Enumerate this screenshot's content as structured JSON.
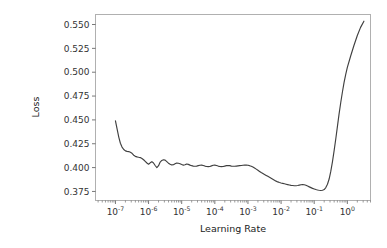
{
  "figure": {
    "background_color": "#ffffff",
    "line_color": "#404040",
    "spine_color": "#b0b0b0",
    "tick_color": "#555555",
    "text_color": "#333333"
  },
  "chart_data": {
    "type": "line",
    "title": "",
    "xlabel": "Learning Rate",
    "ylabel": "Loss",
    "xscale": "log",
    "yscale": "linear",
    "grid": false,
    "legend": null,
    "xlim": [
      2.5e-08,
      5.0
    ],
    "ylim": [
      0.3655,
      0.5605
    ],
    "xticks": [
      1e-07,
      1e-06,
      1e-05,
      0.0001,
      0.001,
      0.01,
      0.1,
      1
    ],
    "xtick_labels": [
      "10⁻⁷",
      "10⁻⁶",
      "10⁻⁵",
      "10⁻⁴",
      "10⁻³",
      "10⁻²",
      "10⁻¹",
      "10⁰"
    ],
    "xtick_mantissa": [
      "10",
      "10",
      "10",
      "10",
      "10",
      "10",
      "10",
      "10"
    ],
    "xtick_exponent": [
      "-7",
      "-6",
      "-5",
      "-4",
      "-3",
      "-2",
      "-1",
      "0"
    ],
    "yticks": [
      0.375,
      0.4,
      0.425,
      0.45,
      0.475,
      0.5,
      0.525,
      0.55
    ],
    "ytick_labels": [
      "0.375",
      "0.400",
      "0.425",
      "0.450",
      "0.475",
      "0.500",
      "0.525",
      "0.550"
    ],
    "series": [
      {
        "name": "loss",
        "color": "#404040",
        "x": [
          1e-07,
          1.12e-07,
          1.26e-07,
          1.41e-07,
          1.58e-07,
          1.78e-07,
          2e-07,
          2.24e-07,
          2.51e-07,
          2.82e-07,
          3.16e-07,
          3.55e-07,
          3.98e-07,
          4.47e-07,
          5.01e-07,
          5.62e-07,
          6.31e-07,
          7.08e-07,
          7.94e-07,
          8.91e-07,
          1e-06,
          1.12e-06,
          1.26e-06,
          1.41e-06,
          1.58e-06,
          1.78e-06,
          2e-06,
          2.24e-06,
          2.51e-06,
          2.82e-06,
          3.16e-06,
          3.55e-06,
          3.98e-06,
          4.47e-06,
          5.01e-06,
          5.62e-06,
          6.31e-06,
          7.08e-06,
          7.94e-06,
          8.91e-06,
          1e-05,
          1.12e-05,
          1.26e-05,
          1.41e-05,
          1.58e-05,
          1.78e-05,
          2e-05,
          2.24e-05,
          2.51e-05,
          2.82e-05,
          3.16e-05,
          3.55e-05,
          3.98e-05,
          4.47e-05,
          5.01e-05,
          5.62e-05,
          6.31e-05,
          7.08e-05,
          7.94e-05,
          8.91e-05,
          0.0001,
          0.000112,
          0.000126,
          0.000141,
          0.000158,
          0.000178,
          0.0002,
          0.000224,
          0.000251,
          0.000282,
          0.000316,
          0.000355,
          0.000398,
          0.000447,
          0.000501,
          0.000562,
          0.000631,
          0.000708,
          0.000794,
          0.000891,
          0.001,
          0.00112,
          0.00126,
          0.00141,
          0.00158,
          0.00178,
          0.002,
          0.00224,
          0.00251,
          0.00282,
          0.00316,
          0.00355,
          0.00398,
          0.00447,
          0.00501,
          0.00562,
          0.00631,
          0.00708,
          0.00794,
          0.00891,
          0.01,
          0.0112,
          0.0126,
          0.0141,
          0.0158,
          0.0178,
          0.02,
          0.0224,
          0.0251,
          0.0282,
          0.0316,
          0.0355,
          0.0398,
          0.0447,
          0.0501,
          0.0562,
          0.0631,
          0.0708,
          0.0794,
          0.0891,
          0.1,
          0.112,
          0.126,
          0.141,
          0.158,
          0.178,
          0.2,
          0.224,
          0.251,
          0.282,
          0.316,
          0.355,
          0.398,
          0.447,
          0.501,
          0.562,
          0.631,
          0.708,
          0.794,
          0.891,
          1.0,
          1.26,
          1.58,
          2.0,
          2.51,
          3.16
        ],
        "y": [
          0.449,
          0.4405,
          0.432,
          0.4255,
          0.4215,
          0.419,
          0.4175,
          0.417,
          0.4168,
          0.416,
          0.415,
          0.413,
          0.4118,
          0.4112,
          0.4108,
          0.4105,
          0.4095,
          0.4082,
          0.4065,
          0.4048,
          0.4035,
          0.405,
          0.4062,
          0.4048,
          0.4022,
          0.4,
          0.402,
          0.4058,
          0.4075,
          0.4082,
          0.4078,
          0.4062,
          0.4046,
          0.4035,
          0.4028,
          0.403,
          0.404,
          0.4048,
          0.4046,
          0.404,
          0.4032,
          0.4026,
          0.403,
          0.4038,
          0.4034,
          0.4026,
          0.402,
          0.4016,
          0.4014,
          0.4016,
          0.402,
          0.4024,
          0.4026,
          0.4022,
          0.4016,
          0.4012,
          0.401,
          0.4012,
          0.4018,
          0.4024,
          0.4026,
          0.4022,
          0.4016,
          0.4012,
          0.401,
          0.4012,
          0.4016,
          0.402,
          0.4022,
          0.402,
          0.4016,
          0.4014,
          0.4014,
          0.4016,
          0.4018,
          0.402,
          0.4022,
          0.4024,
          0.4026,
          0.4026,
          0.4024,
          0.402,
          0.4014,
          0.4006,
          0.3996,
          0.3984,
          0.3972,
          0.396,
          0.3948,
          0.3938,
          0.3928,
          0.3918,
          0.3908,
          0.3898,
          0.3888,
          0.3878,
          0.3868,
          0.3858,
          0.385,
          0.3843,
          0.3838,
          0.3834,
          0.383,
          0.3826,
          0.3822,
          0.3818,
          0.3814,
          0.3812,
          0.381,
          0.381,
          0.3812,
          0.3816,
          0.382,
          0.3822,
          0.382,
          0.3814,
          0.3806,
          0.3798,
          0.379,
          0.3782,
          0.3776,
          0.377,
          0.3765,
          0.3762,
          0.376,
          0.3762,
          0.377,
          0.379,
          0.3825,
          0.388,
          0.396,
          0.406,
          0.4175,
          0.43,
          0.443,
          0.456,
          0.468,
          0.479,
          0.489,
          0.4975,
          0.505,
          0.517,
          0.528,
          0.5385,
          0.547,
          0.5535
        ]
      }
    ]
  },
  "axes": {
    "xlabel": "Learning Rate",
    "ylabel": "Loss"
  }
}
